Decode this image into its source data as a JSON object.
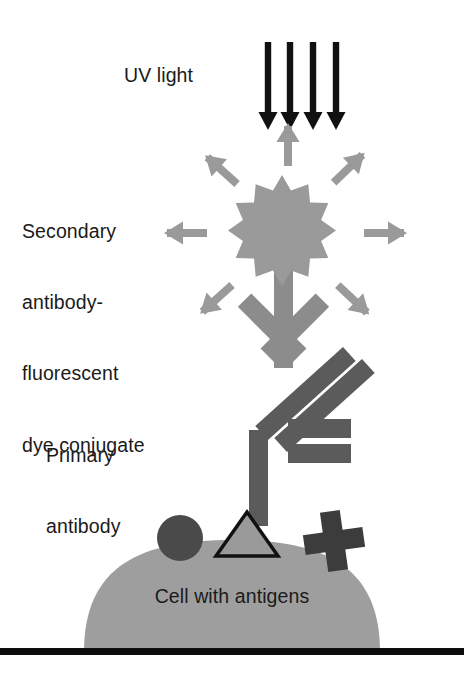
{
  "diagram": {
    "labels": {
      "uv_light": "UV light",
      "secondary_antibody_line1": "Secondary",
      "secondary_antibody_line2": "antibody-",
      "secondary_antibody_line3": "fluorescent",
      "secondary_antibody_line4": "dye conjugate",
      "primary_antibody_line1": "Primary",
      "primary_antibody_line2": "antibody",
      "cell": "Cell with antigens"
    },
    "colors": {
      "background": "#ffffff",
      "uv_arrow": "#111111",
      "fluorescence_star": "#9a9a9a",
      "emission_arrow": "#9a9a9a",
      "secondary_antibody": "#8c8c8c",
      "primary_antibody": "#5b5b5b",
      "cell_body": "#9e9e9e",
      "antigen_circle": "#4a4a4a",
      "antigen_triangle_fill": "#9a9a9a",
      "antigen_triangle_stroke": "#111111",
      "antigen_cross": "#3c3c3c",
      "baseline": "#0d0d0d",
      "text": "#1a1a1a"
    },
    "elements": {
      "uv_arrow_count": 4,
      "emission_arrow_count": 7,
      "star_points": 14,
      "antigen_count": 3,
      "antigen_shapes": [
        "circle",
        "triangle",
        "cross"
      ]
    }
  }
}
